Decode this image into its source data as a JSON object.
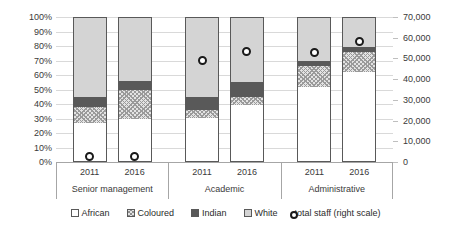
{
  "chart_data": {
    "type": "bar",
    "subtype": "stacked-100-percent-with-overlay-markers",
    "title": "",
    "xlabel": "",
    "ylabel": "",
    "y_left": {
      "label": "",
      "ticks": [
        "0%",
        "10%",
        "20%",
        "30%",
        "40%",
        "50%",
        "60%",
        "70%",
        "80%",
        "90%",
        "100%"
      ],
      "values": [
        0,
        10,
        20,
        30,
        40,
        50,
        60,
        70,
        80,
        90,
        100
      ],
      "ylim": [
        0,
        100
      ],
      "unit": "percent"
    },
    "y_right": {
      "label": "total staff (right scale)",
      "ticks": [
        "0",
        "10,000",
        "20,000",
        "30,000",
        "40,000",
        "50,000",
        "60,000",
        "70,000"
      ],
      "values": [
        0,
        10000,
        20000,
        30000,
        40000,
        50000,
        60000,
        70000
      ],
      "ylim": [
        0,
        70000
      ],
      "unit": "staff"
    },
    "grid": true,
    "legend_position": "bottom",
    "groups": [
      {
        "label": "Senior management",
        "years": [
          "2011",
          "2016"
        ]
      },
      {
        "label": "Academic",
        "years": [
          "2011",
          "2016"
        ]
      },
      {
        "label": "Administrative",
        "years": [
          "2011",
          "2016"
        ]
      }
    ],
    "categories": [
      "2011",
      "2016",
      "2011",
      "2016",
      "2011",
      "2016"
    ],
    "series": [
      {
        "name": "African",
        "color": "#ffffff",
        "pattern": "solid-outline",
        "values": [
          27.0,
          30.0,
          30.5,
          39.0,
          51.5,
          62.0
        ]
      },
      {
        "name": "Coloured",
        "color": "#e3e3e3",
        "pattern": "crosshatch",
        "values": [
          11.0,
          20.0,
          5.5,
          6.0,
          14.5,
          14.0
        ]
      },
      {
        "name": "Indian",
        "color": "#595959",
        "pattern": "solid",
        "values": [
          7.0,
          6.0,
          9.0,
          10.0,
          4.0,
          3.0
        ]
      },
      {
        "name": "White",
        "color": "#d4d4d4",
        "pattern": "solid",
        "values": [
          55.0,
          44.0,
          55.0,
          45.0,
          30.0,
          21.0
        ]
      }
    ],
    "overlay": {
      "name": "total staff (right scale)",
      "marker": "open-circle",
      "color": "#1a1a1a",
      "axis": "right",
      "values": [
        2500,
        2800,
        49000,
        53500,
        53000,
        58000
      ],
      "percent_positions": [
        3.6,
        4.0,
        70.0,
        76.4,
        75.7,
        82.9
      ]
    }
  },
  "legend": {
    "items": [
      {
        "label": "African",
        "swatch": "african-swatch"
      },
      {
        "label": "Coloured",
        "swatch": "coloured-swatch"
      },
      {
        "label": "Indian",
        "swatch": "indian-swatch"
      },
      {
        "label": "White",
        "swatch": "white-swatch"
      },
      {
        "label": "total staff (right scale)",
        "swatch": "total-staff-marker"
      }
    ]
  },
  "colors": {
    "african": "#ffffff",
    "coloured": "#e3e3e3",
    "indian": "#595959",
    "white": "#d4d4d4",
    "marker": "#1a1a1a",
    "gridline": "#d9d9d9",
    "axis": "#a6a6a6",
    "background": "#ffffff"
  }
}
